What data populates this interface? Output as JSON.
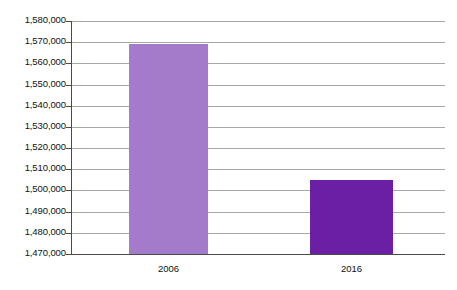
{
  "chart_data": {
    "type": "bar",
    "title": "",
    "subtitle": "",
    "xlabel": "",
    "ylabel": "",
    "categories": [
      "2006",
      "2016"
    ],
    "values": [
      1569000,
      1505000
    ],
    "series": [
      {
        "name": "",
        "values": [
          1569000,
          1505000
        ],
        "colors": [
          "#a47bcb",
          "#6a1fa5"
        ]
      }
    ],
    "ylim": [
      1470000,
      1580000
    ],
    "ytick_step": 10000,
    "ytick_labels": [
      "1,580,000",
      "1,570,000",
      "1,560,000",
      "1,550,000",
      "1,540,000",
      "1,530,000",
      "1,520,000",
      "1,510,000",
      "1,500,000",
      "1,490,000",
      "1,480,000",
      "1,470,000"
    ],
    "ytick_values": [
      1580000,
      1570000,
      1560000,
      1550000,
      1540000,
      1530000,
      1520000,
      1510000,
      1500000,
      1490000,
      1480000,
      1470000
    ],
    "grid": true,
    "grid_axis": "y",
    "legend": false,
    "legend_position": "none",
    "annotations": []
  },
  "colors": {
    "background": "#ffffff",
    "gridline": "#a8a8a8",
    "axis": "#4a4a4a",
    "bar_2006": "#a47bcb",
    "bar_2016": "#6a1fa5",
    "text": "#111111"
  }
}
